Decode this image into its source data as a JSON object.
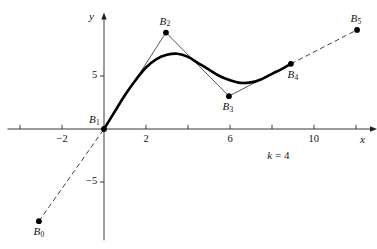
{
  "figure": {
    "caption_param": {
      "symbol": "k",
      "equals": "=",
      "value": "4"
    }
  },
  "axes": {
    "x_label": "x",
    "y_label": "y",
    "x_ticks": [
      {
        "value": -2,
        "label": "−2"
      },
      {
        "value": 2,
        "label": "2"
      },
      {
        "value": 6,
        "label": "6"
      },
      {
        "value": 10,
        "label": "10"
      }
    ],
    "x_tick_values_unlabeled": [
      -4,
      4,
      8,
      12
    ],
    "y_ticks": [
      {
        "value": 5,
        "label": "5"
      },
      {
        "value": -5,
        "label": "−5"
      }
    ],
    "origin_px": {
      "x": 104,
      "y": 129
    },
    "scale_px_per_unit": {
      "x": 21.0,
      "y": 10.6
    },
    "x_range": [
      -4.6,
      13.0
    ],
    "y_range": [
      -10.5,
      11.0
    ]
  },
  "chart_data": {
    "type": "line",
    "title": "",
    "xlabel": "x",
    "ylabel": "y",
    "grid": false,
    "legend": null,
    "xlim": [
      -4.6,
      13.0
    ],
    "ylim": [
      -10.5,
      11.0
    ],
    "annotations": [
      {
        "text": "k = 4",
        "x": 8.3,
        "y": -2.5
      }
    ],
    "control_points": [
      {
        "name": "B0",
        "label": "B",
        "sub": "0",
        "x": -3.1,
        "y": -8.7,
        "label_pos": "below-left"
      },
      {
        "name": "B1",
        "label": "B",
        "sub": "1",
        "x": 0.0,
        "y": 0.0,
        "label_pos": "above-left"
      },
      {
        "name": "B2",
        "label": "B",
        "sub": "2",
        "x": 2.95,
        "y": 9.1,
        "label_pos": "above"
      },
      {
        "name": "B3",
        "label": "B",
        "sub": "3",
        "x": 5.95,
        "y": 3.1,
        "label_pos": "below"
      },
      {
        "name": "B4",
        "label": "B",
        "sub": "4",
        "x": 8.9,
        "y": 6.15,
        "label_pos": "below-right"
      },
      {
        "name": "B5",
        "label": "B",
        "sub": "5",
        "x": 12.05,
        "y": 9.35,
        "label_pos": "above"
      }
    ],
    "control_polygon_solid_segments": [
      {
        "from": "B1",
        "to": "B2"
      },
      {
        "from": "B2",
        "to": "B3"
      },
      {
        "from": "B3",
        "to": "B4"
      }
    ],
    "control_polygon_dashed_segments": [
      {
        "from": "B0",
        "to": "B1"
      },
      {
        "from": "B4",
        "to": "B5"
      }
    ],
    "series": [
      {
        "name": "B-spline curve (order k = 4)",
        "style": "thick-solid",
        "points": [
          {
            "x": 0.0,
            "y": 0.0
          },
          {
            "x": 0.5,
            "y": 1.6
          },
          {
            "x": 1.0,
            "y": 3.2
          },
          {
            "x": 1.5,
            "y": 4.6
          },
          {
            "x": 2.0,
            "y": 5.8
          },
          {
            "x": 2.5,
            "y": 6.6
          },
          {
            "x": 3.0,
            "y": 7.0
          },
          {
            "x": 3.5,
            "y": 7.1
          },
          {
            "x": 4.0,
            "y": 6.8
          },
          {
            "x": 4.5,
            "y": 6.2
          },
          {
            "x": 5.0,
            "y": 5.6
          },
          {
            "x": 5.5,
            "y": 5.0
          },
          {
            "x": 6.0,
            "y": 4.6
          },
          {
            "x": 6.5,
            "y": 4.35
          },
          {
            "x": 7.0,
            "y": 4.4
          },
          {
            "x": 7.5,
            "y": 4.7
          },
          {
            "x": 8.0,
            "y": 5.2
          },
          {
            "x": 8.5,
            "y": 5.7
          },
          {
            "x": 8.9,
            "y": 6.15
          }
        ]
      }
    ]
  }
}
